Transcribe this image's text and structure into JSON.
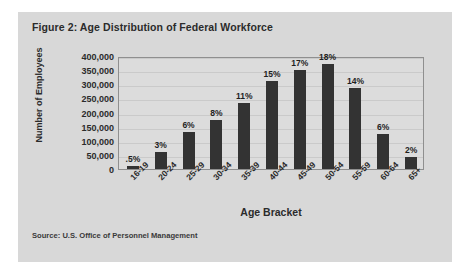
{
  "figure": {
    "title": "Figure 2: Age Distribution of Federal Workforce",
    "source": "Source: U.S. Office of Personnel Management"
  },
  "chart_data": {
    "type": "bar",
    "title": "Figure 2: Age Distribution of Federal Workforce",
    "xlabel": "Age Bracket",
    "ylabel": "Number of Employees",
    "ylim": [
      0,
      400000
    ],
    "ytick_labels": [
      "400,000",
      "350,000",
      "300,000",
      "250,000",
      "200,000",
      "150,000",
      "100,000",
      "50,000",
      "0"
    ],
    "ytick_values": [
      400000,
      350000,
      300000,
      250000,
      200000,
      150000,
      100000,
      50000,
      0
    ],
    "grid": true,
    "legend": "none",
    "categories": [
      "16-19",
      "20-24",
      "25-29",
      "30-34",
      "35-39",
      "40-44",
      "45-49",
      "50-54",
      "55-59",
      "60-64",
      "65+"
    ],
    "values": [
      10000,
      62000,
      130000,
      172000,
      235000,
      310000,
      350000,
      372000,
      287000,
      125000,
      42000
    ],
    "data_labels": [
      ".5%",
      "3%",
      "6%",
      "8%",
      "11%",
      "15%",
      "17%",
      "18%",
      "14%",
      "6%",
      "2%"
    ],
    "percentages": [
      0.5,
      3,
      6,
      8,
      11,
      15,
      17,
      18,
      14,
      6,
      2
    ]
  },
  "colors": {
    "bar": "#333333",
    "plot_background": "#dcdcdc",
    "figure_background": "#d8d8d8",
    "page_background": "#ffffff",
    "text": "#2b2b2b"
  }
}
